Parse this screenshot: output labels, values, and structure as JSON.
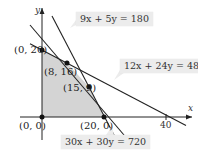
{
  "diagram": {
    "type": "linear-programming-feasible-region",
    "axes": {
      "x_label": "x",
      "y_label": "y",
      "x_tick": "40"
    },
    "vertices": [
      {
        "label": "(0, 20)",
        "x": 0,
        "y": 20
      },
      {
        "label": "(8, 16)",
        "x": 8,
        "y": 16
      },
      {
        "label": "(15, 9)",
        "x": 15,
        "y": 9
      },
      {
        "label": "(20, 0)",
        "x": 20,
        "y": 0
      },
      {
        "label": "(0, 0)",
        "x": 0,
        "y": 0
      }
    ],
    "constraints": [
      {
        "label": "9x + 5y = 180"
      },
      {
        "label": "12x + 24y = 480"
      },
      {
        "label": "30x + 30y = 720"
      }
    ],
    "colors": {
      "region": "#d4d4d4",
      "line": "#222222",
      "label_bg": "#ececec"
    }
  }
}
